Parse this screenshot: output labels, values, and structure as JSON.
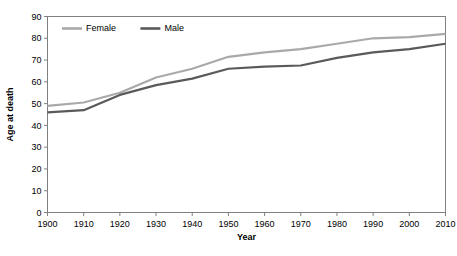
{
  "chart_data": {
    "type": "line",
    "title": "",
    "xlabel": "Year",
    "ylabel": "Age at death",
    "x": [
      1900,
      1910,
      1920,
      1930,
      1940,
      1950,
      1960,
      1970,
      1980,
      1990,
      2000,
      2010
    ],
    "categories": [
      "1900",
      "1910",
      "1920",
      "1930",
      "1940",
      "1950",
      "1960",
      "1970",
      "1980",
      "1990",
      "2000",
      "2010"
    ],
    "series": [
      {
        "name": "Female",
        "color": "#a9a9a9",
        "values": [
          49,
          50.5,
          55,
          62,
          66,
          71.5,
          73.5,
          75,
          77.5,
          80,
          80.5,
          82
        ]
      },
      {
        "name": "Male",
        "color": "#5a5a5a",
        "values": [
          46,
          47,
          54,
          58.5,
          61.5,
          66,
          67,
          67.5,
          71,
          73.5,
          75,
          77.5
        ]
      }
    ],
    "xlim": [
      1900,
      2010
    ],
    "ylim": [
      0,
      90
    ],
    "xticks": [
      1900,
      1910,
      1920,
      1930,
      1940,
      1950,
      1960,
      1970,
      1980,
      1990,
      2000,
      2010
    ],
    "yticks": [
      0,
      10,
      20,
      30,
      40,
      50,
      60,
      70,
      80,
      90
    ],
    "ytick_labels": [
      "0",
      "10",
      "20",
      "30",
      "40",
      "50",
      "60",
      "70",
      "80",
      "90"
    ],
    "xtick_labels": [
      "1900",
      "1910",
      "1920",
      "1930",
      "1940",
      "1950",
      "1960",
      "1970",
      "1980",
      "1990",
      "2000",
      "2010"
    ],
    "grid": false,
    "legend_position": "top-left-inside",
    "legend": [
      "Female",
      "Male"
    ],
    "background_color": "#ffffff",
    "frame_color": "#808080"
  }
}
